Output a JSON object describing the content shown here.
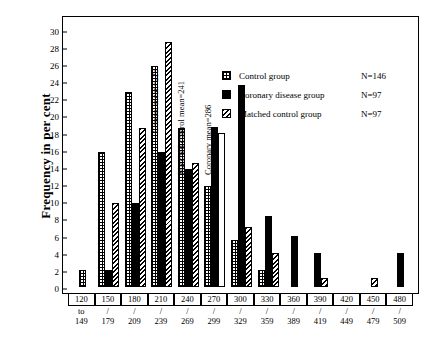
{
  "chart_data": {
    "type": "bar",
    "title": "",
    "xlabel": "",
    "ylabel": "Frequency in per cent",
    "ylim": [
      0,
      31
    ],
    "yticks": [
      0,
      2,
      4,
      6,
      8,
      10,
      12,
      14,
      16,
      18,
      20,
      22,
      24,
      26,
      28,
      30
    ],
    "grid": false,
    "legend_position": "top-right",
    "categories": [
      "120 to 149",
      "150 / 179",
      "180 / 209",
      "210 / 239",
      "240 / 269",
      "270 / 299",
      "300 / 329",
      "330 / 359",
      "360 / 389",
      "390 / 419",
      "420 / 449",
      "450 / 479",
      "480 / 509"
    ],
    "category_parts": [
      {
        "top": "120",
        "mid": "to",
        "bot": "149"
      },
      {
        "top": "150",
        "mid": "/",
        "bot": "179"
      },
      {
        "top": "180",
        "mid": "/",
        "bot": "209"
      },
      {
        "top": "210",
        "mid": "/",
        "bot": "239"
      },
      {
        "top": "240",
        "mid": "/",
        "bot": "269"
      },
      {
        "top": "270",
        "mid": "/",
        "bot": "299"
      },
      {
        "top": "300",
        "mid": "/",
        "bot": "329"
      },
      {
        "top": "330",
        "mid": "/",
        "bot": "359"
      },
      {
        "top": "360",
        "mid": "/",
        "bot": "389"
      },
      {
        "top": "390",
        "mid": "/",
        "bot": "419"
      },
      {
        "top": "420",
        "mid": "/",
        "bot": "449"
      },
      {
        "top": "450",
        "mid": "/",
        "bot": "479"
      },
      {
        "top": "480",
        "mid": "/",
        "bot": "509"
      }
    ],
    "series": [
      {
        "name": "Control group",
        "n": "N=146",
        "pattern": "cross-hatch",
        "values": [
          2.0,
          15.7,
          22.7,
          25.7,
          18.5,
          11.8,
          5.5,
          2.0,
          0,
          0,
          0,
          0,
          0
        ]
      },
      {
        "name": "Coronary disease group",
        "n": "N=97",
        "pattern": "solid-black",
        "values": [
          0,
          2.0,
          9.8,
          15.7,
          13.8,
          18.7,
          23.5,
          8.3,
          6.0,
          4.0,
          0,
          0,
          4.0
        ]
      },
      {
        "name": "Matched control group",
        "n": "N=97",
        "pattern": "diagonal-hatch",
        "values": [
          0,
          9.8,
          18.5,
          28.5,
          14.5,
          18.0,
          7.0,
          4.0,
          0,
          1.0,
          0,
          1.0,
          0
        ],
        "open_indices": [
          5
        ]
      }
    ],
    "annotations": [
      {
        "text": "Control mean=225",
        "category_index": 3
      },
      {
        "text": "Matched control mean=241",
        "category_index": 4
      },
      {
        "text": "Coronary mean=286",
        "category_index": 5
      }
    ]
  },
  "legend": {
    "rows": [
      {
        "label": "Control group",
        "n": "N=146"
      },
      {
        "label": "Coronary disease group",
        "n": "N=97"
      },
      {
        "label": "Matched control group",
        "n": "N=97"
      }
    ]
  },
  "axis": {
    "y_title": "Frequency in per cent"
  }
}
